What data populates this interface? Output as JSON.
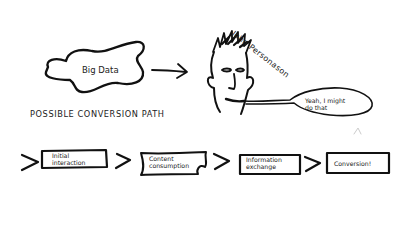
{
  "diagram": {
    "source_node": {
      "label": "Big Data"
    },
    "persona": {
      "name": "John Personason",
      "speech": [
        "Yeah, I might",
        "do that"
      ]
    },
    "path": {
      "title": "POSSIBLE CONVERSION PATH",
      "steps": [
        {
          "line1": "Initial",
          "line2": "interaction"
        },
        {
          "line1": "Content",
          "line2": "consumption"
        },
        {
          "line1": "Information",
          "line2": "exchange"
        },
        {
          "line1": "Conversion!",
          "line2": ""
        }
      ]
    },
    "colors": {
      "ink": "#111111",
      "background": "#ffffff"
    }
  }
}
